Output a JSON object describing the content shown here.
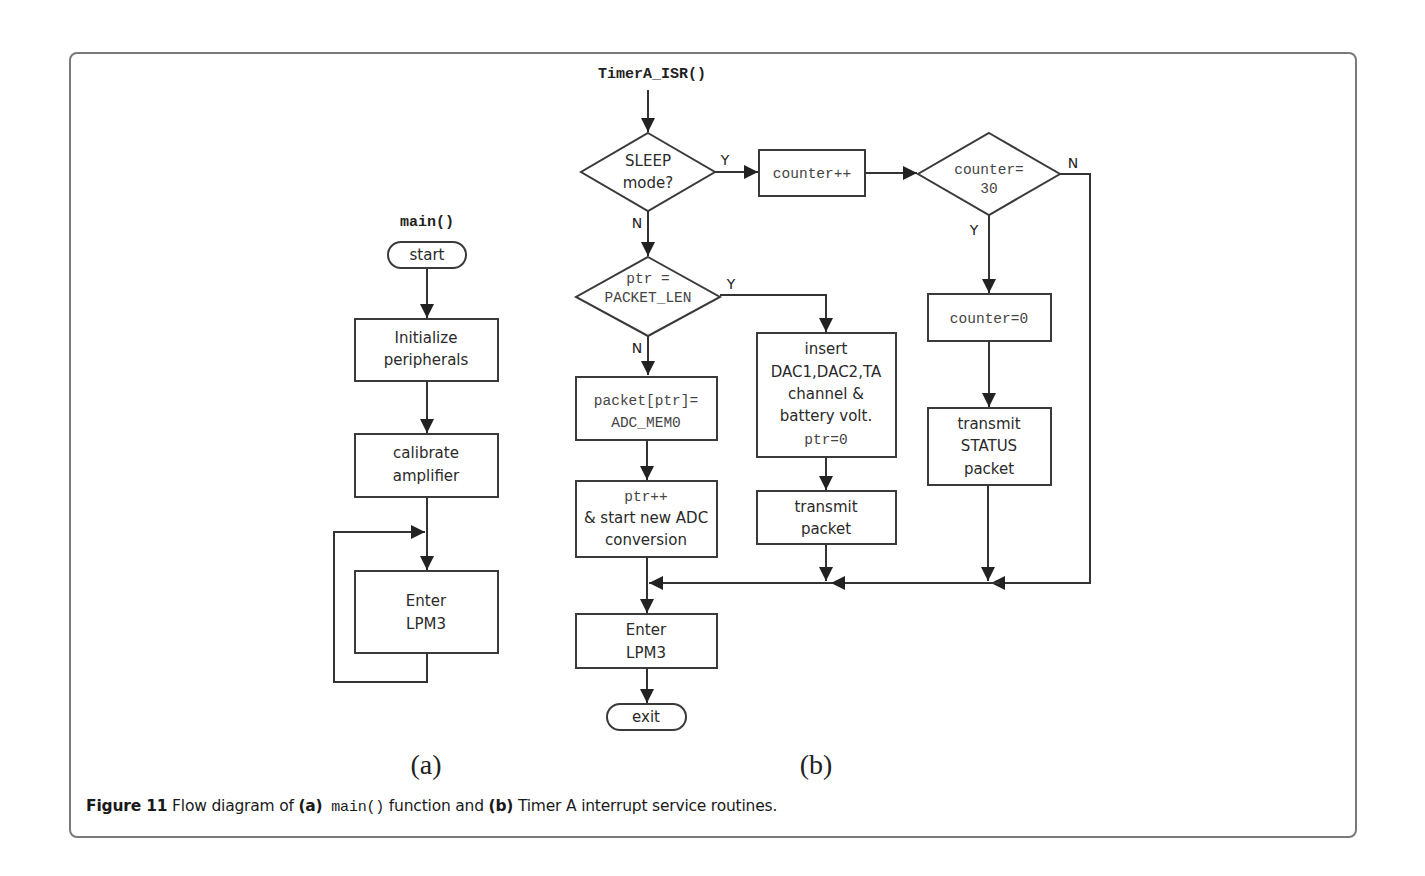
{
  "figure": {
    "caption": {
      "number": "Figure 11",
      "text_1": " Flow diagram of ",
      "part_a": "(a)",
      "code": " main()",
      "text_2": " function and ",
      "part_b": "(b)",
      "text_3": " Timer A interrupt service routines."
    },
    "sublabels": {
      "a": "(a)",
      "b": "(b)"
    }
  },
  "diagram_a": {
    "title": "main()",
    "nodes": {
      "start": "start",
      "init": [
        "Initialize",
        "peripherals"
      ],
      "calibrate": [
        "calibrate",
        "amplifier"
      ],
      "lpm": [
        "Enter",
        "LPM3"
      ]
    },
    "edges": [
      [
        "start",
        "init"
      ],
      [
        "init",
        "calibrate"
      ],
      [
        "calibrate",
        "lpm"
      ],
      [
        "lpm",
        "lpm"
      ]
    ]
  },
  "diagram_b": {
    "title": "TimerA_ISR()",
    "nodes": {
      "sleep_check": [
        "SLEEP",
        "mode?"
      ],
      "counter_inc": "counter++",
      "counter_check": [
        "counter=",
        "30"
      ],
      "counter_reset": "counter=0",
      "transmit_status": [
        "transmit",
        "STATUS",
        "packet"
      ],
      "ptr_check": [
        "ptr =",
        "PACKET_LEN"
      ],
      "packet_store": [
        "packet[ptr]=",
        "ADC_MEM0"
      ],
      "ptr_inc": [
        "ptr++",
        "& start new ADC",
        "conversion"
      ],
      "insert_dac": [
        "insert",
        "DAC1,DAC2,TA",
        "channel &",
        "battery volt."
      ],
      "insert_ptr": "ptr=0",
      "transmit_packet": [
        "transmit",
        "packet"
      ],
      "lpm": [
        "Enter",
        "LPM3"
      ],
      "exit": "exit"
    },
    "branch_labels": {
      "sleep_yes": "Y",
      "sleep_no": "N",
      "counter_yes": "Y",
      "counter_no": "N",
      "ptr_yes": "Y",
      "ptr_no": "N"
    },
    "edges": [
      [
        "sleep_check",
        "counter_inc",
        "Y"
      ],
      [
        "sleep_check",
        "ptr_check",
        "N"
      ],
      [
        "counter_inc",
        "counter_check"
      ],
      [
        "counter_check",
        "counter_reset",
        "Y"
      ],
      [
        "counter_check",
        "lpm",
        "N"
      ],
      [
        "counter_reset",
        "transmit_status"
      ],
      [
        "transmit_status",
        "lpm"
      ],
      [
        "ptr_check",
        "insert_dac",
        "Y"
      ],
      [
        "ptr_check",
        "packet_store",
        "N"
      ],
      [
        "packet_store",
        "ptr_inc"
      ],
      [
        "ptr_inc",
        "lpm"
      ],
      [
        "insert_dac",
        "transmit_packet"
      ],
      [
        "transmit_packet",
        "lpm"
      ],
      [
        "lpm",
        "exit"
      ]
    ]
  }
}
